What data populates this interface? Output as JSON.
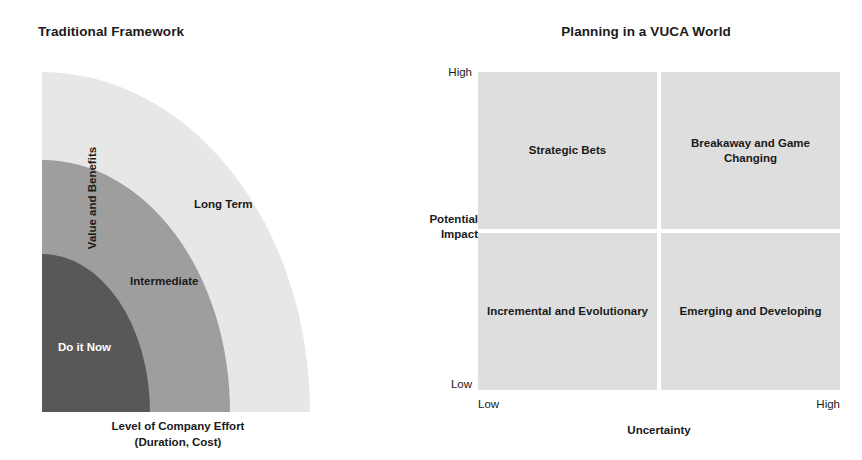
{
  "left_chart": {
    "title": "Traditional Framework",
    "y_axis_label": "Value and Benefits",
    "x_axis_label_line1": "Level of Company Effort",
    "x_axis_label_line2": "(Duration, Cost)",
    "zones": [
      {
        "label": "Long Term",
        "color": "#e7e7e7",
        "text_color": "#1a1a1a"
      },
      {
        "label": "Intermediate",
        "color": "#9e9e9e",
        "text_color": "#1a1a1a"
      },
      {
        "label": "Do it Now",
        "color": "#585858",
        "text_color": "#ffffff"
      }
    ]
  },
  "right_chart": {
    "title": "Planning in a VUCA World",
    "y_axis_label_line1": "Potential",
    "y_axis_label_line2": "Impact",
    "x_axis_label": "Uncertainty",
    "y_tick_high": "High",
    "y_tick_low": "Low",
    "x_tick_low": "Low",
    "x_tick_high": "High",
    "quadrant_color": "#dedede",
    "quadrants": [
      {
        "position": "top-left",
        "label": "Strategic Bets"
      },
      {
        "position": "top-right",
        "label": "Breakaway and Game Changing"
      },
      {
        "position": "bottom-left",
        "label": "Incremental and Evolutionary"
      },
      {
        "position": "bottom-right",
        "label": "Emerging and Developing"
      }
    ]
  },
  "chart_data": {
    "type": "diagram",
    "panels": [
      {
        "name": "Traditional Framework",
        "type": "concentric-quadrant",
        "xlabel": "Level of Company Effort (Duration, Cost)",
        "ylabel": "Value and Benefits",
        "bands": [
          {
            "label": "Do it Now",
            "rank": 1,
            "radius_fraction": 0.4,
            "fill": "#585858"
          },
          {
            "label": "Intermediate",
            "rank": 2,
            "radius_fraction": 0.7,
            "fill": "#9e9e9e"
          },
          {
            "label": "Long Term",
            "rank": 3,
            "radius_fraction": 1.0,
            "fill": "#e7e7e7"
          }
        ]
      },
      {
        "name": "Planning in a VUCA World",
        "type": "2x2-matrix",
        "xlabel": "Uncertainty",
        "ylabel": "Potential Impact",
        "xticks": [
          "Low",
          "High"
        ],
        "yticks": [
          "Low",
          "High"
        ],
        "cells": [
          {
            "x": "Low",
            "y": "High",
            "label": "Strategic Bets"
          },
          {
            "x": "High",
            "y": "High",
            "label": "Breakaway and Game Changing"
          },
          {
            "x": "Low",
            "y": "Low",
            "label": "Incremental and Evolutionary"
          },
          {
            "x": "High",
            "y": "Low",
            "label": "Emerging and Developing"
          }
        ]
      }
    ]
  }
}
